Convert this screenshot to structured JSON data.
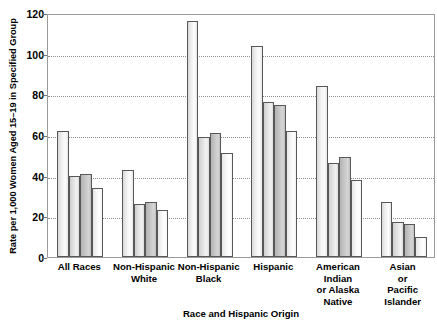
{
  "chart_data": {
    "type": "bar",
    "title": "",
    "xlabel": "Race and Hispanic Origin",
    "ylabel": "Rate per 1,000 Women Aged 15–19 in Specified Group",
    "ylim": [
      0,
      120
    ],
    "ytick_labels": [
      "0",
      "20",
      "40",
      "60",
      "80",
      "100",
      "120"
    ],
    "ytick_values": [
      0,
      20,
      40,
      60,
      80,
      100,
      120
    ],
    "grid": "horizontal-dotted",
    "legend": "none",
    "categories": [
      "All Races",
      "Non-Hispanic White",
      "Non-Hispanic Black",
      "Hispanic",
      "American Indian or Alaska Native",
      "Asian or Pacific Islander"
    ],
    "category_label_lines": [
      [
        "All Races"
      ],
      [
        "Non-Hispanic",
        "White"
      ],
      [
        "Non-Hispanic",
        "Black"
      ],
      [
        "Hispanic"
      ],
      [
        "American",
        "Indian",
        "or Alaska",
        "Native"
      ],
      [
        "Asian",
        "or",
        "Pacific",
        "Islander"
      ]
    ],
    "series": [
      {
        "name": "series-1",
        "values": [
          62,
          43,
          116,
          104,
          84,
          27
        ]
      },
      {
        "name": "series-2",
        "values": [
          40,
          26,
          59,
          76,
          46,
          17
        ]
      },
      {
        "name": "series-3",
        "values": [
          41,
          27,
          61,
          75,
          49,
          16
        ]
      },
      {
        "name": "series-4",
        "values": [
          34,
          23,
          51,
          62,
          38,
          10
        ]
      }
    ]
  },
  "colors": {
    "frame": "#9a9a9a",
    "gridline": "#8d8d8d",
    "bar_outline": "#58585a",
    "text": "#000000",
    "background": "#ffffff"
  }
}
